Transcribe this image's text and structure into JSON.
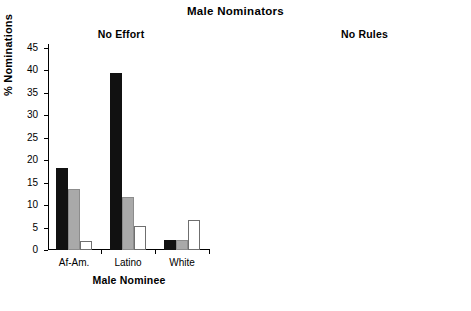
{
  "chart_data": [
    {
      "type": "bar",
      "title": "Male Nominators",
      "subtitle": "No Effort",
      "panel": "left",
      "xlabel": "Male Nominee",
      "ylabel": "% Nominations",
      "ylim": [
        0,
        45
      ],
      "yticks": [
        0,
        5,
        10,
        15,
        20,
        25,
        30,
        35,
        40,
        45
      ],
      "grid": false,
      "legend": "none",
      "categories": [
        "Af-Am.",
        "Latino",
        "White"
      ],
      "series": [
        {
          "name": "black",
          "color": "#111111",
          "values": [
            18.2,
            39.5,
            2.2
          ]
        },
        {
          "name": "gray",
          "color": "#a9a9a9",
          "values": [
            13.6,
            11.8,
            2.2
          ]
        },
        {
          "name": "white",
          "color": "#ffffff",
          "values": [
            2.1,
            5.3,
            6.6
          ]
        }
      ]
    },
    {
      "type": "bar",
      "title": "Male Nominators",
      "subtitle": "No Rules",
      "panel": "right",
      "xlabel": "Male Nominee",
      "ylabel": "% Nominations",
      "ylim": [
        0,
        45
      ],
      "yticks": [
        0,
        5,
        10,
        15,
        20,
        25,
        30,
        35,
        40,
        45
      ],
      "grid": false,
      "legend": "none",
      "categories": [
        "Af-Am.",
        "Latino",
        "White"
      ],
      "series": [
        {
          "name": "black",
          "color": "#111111",
          "values": [
            17.1,
            37.3,
            0.7
          ]
        },
        {
          "name": "gray",
          "color": "#a9a9a9",
          "values": [
            13.5,
            19.8,
            0.7
          ]
        },
        {
          "name": "white",
          "color": "#ffffff",
          "values": [
            2.3,
            4.6,
            4.7
          ]
        }
      ]
    }
  ],
  "figure": {
    "main_title": "Male Nominators",
    "left": {
      "subtitle": "No Effort",
      "xaxis_title": "Male Nominee",
      "yaxis_title": "% Nominations",
      "ytick_labels": [
        "45",
        "40",
        "35",
        "30",
        "25",
        "20",
        "15",
        "10",
        "5",
        "0"
      ],
      "group_labels": [
        "Af-Am.",
        "Latino",
        "White"
      ]
    },
    "right": {
      "subtitle": "No Rules",
      "xaxis_title": "Male Nominee",
      "ytick_labels": [
        "45",
        "40",
        "35",
        "30",
        "25",
        "20",
        "15",
        "10",
        "5",
        "0"
      ],
      "group_labels": [
        "Af-Am.",
        "Latino",
        "White"
      ]
    }
  }
}
